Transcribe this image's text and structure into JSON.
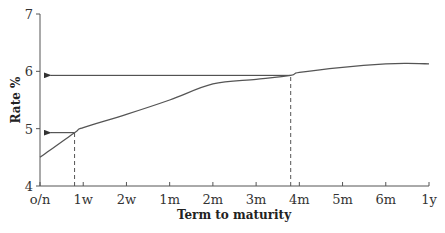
{
  "chart_data": {
    "type": "line",
    "title": "",
    "xlabel": "Term to maturity",
    "ylabel": "Rate %",
    "ylim": [
      4,
      7
    ],
    "yticks": [
      "4",
      "5",
      "6",
      "7"
    ],
    "categories": [
      "o/n",
      "1w",
      "2w",
      "1m",
      "2m",
      "3m",
      "4m",
      "5m",
      "6m",
      "1y"
    ],
    "grid": false,
    "legend": null,
    "series": [
      {
        "name": "Yield curve",
        "x": [
          0,
          0.8,
          1.0,
          2.0,
          3.0,
          4.0,
          5.0,
          5.8,
          6.0,
          7.0,
          8.0,
          8.5,
          9.0
        ],
        "values": [
          4.5,
          4.93,
          5.02,
          5.25,
          5.5,
          5.78,
          5.86,
          5.93,
          5.98,
          6.07,
          6.13,
          6.14,
          6.13
        ]
      }
    ],
    "annotations": [
      {
        "type": "dashed-vertical",
        "x": 0.8,
        "from_y": 4,
        "to_y": 4.93
      },
      {
        "type": "arrow-left",
        "y": 4.93,
        "from_x": 0.8,
        "to_x": 0.2
      },
      {
        "type": "dashed-vertical",
        "x": 5.8,
        "from_y": 4,
        "to_y": 5.93
      },
      {
        "type": "arrow-left",
        "y": 5.93,
        "from_x": 5.8,
        "to_x": 0.2
      }
    ]
  },
  "axes": {
    "x_title": "Term to maturity",
    "y_title": "Rate %",
    "x_ticks": [
      "o/n",
      "1w",
      "2w",
      "1m",
      "2m",
      "3m",
      "4m",
      "5m",
      "6m",
      "1y"
    ],
    "y_ticks": [
      "4",
      "5",
      "6",
      "7"
    ]
  }
}
